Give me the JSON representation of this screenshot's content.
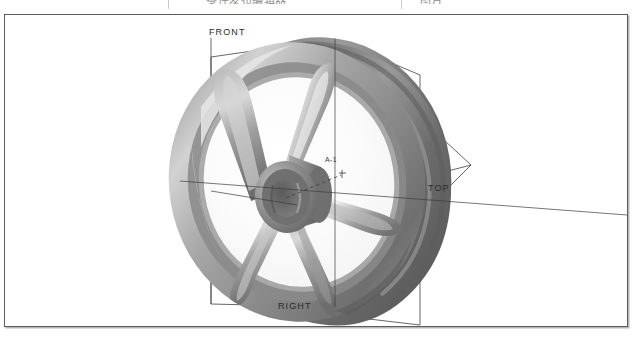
{
  "window": {
    "titlebar_text": "零件发布编辑器",
    "titlebar_right_text": "图片"
  },
  "viewport": {
    "name": "3d-model-viewport",
    "background_color": "#ffffff",
    "border_color": "#5c5c5c"
  },
  "labels": {
    "front": "FRONT",
    "top": "TOP",
    "right": "RIGHT",
    "origin": "A-1"
  },
  "model": {
    "name": "flywheel-pulley",
    "description": "Five-spoke grooved flywheel / pulley, shaded grey, isometric view",
    "spoke_count": 5,
    "colors": {
      "rim_dark": "#6e6e6e",
      "rim_mid": "#8f8f8f",
      "rim_light": "#c8c8c8",
      "highlight": "#e4e4e4",
      "shadow": "#555555",
      "hub": "#7d7d7d"
    }
  },
  "datum_planes": [
    {
      "name": "front-plane",
      "label": "FRONT"
    },
    {
      "name": "top-plane",
      "label": "TOP"
    },
    {
      "name": "right-plane",
      "label": "RIGHT"
    }
  ],
  "axes": {
    "color": "#3c3c3c",
    "origin_label": "A-1"
  }
}
